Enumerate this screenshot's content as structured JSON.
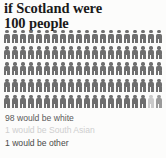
{
  "title": {
    "line1": "if Scotland were",
    "line2": "100 people"
  },
  "colors": {
    "background": "#fcfcfb",
    "title_text": "#1a1a1a",
    "white_group": "#6e6e6e",
    "south_asian_group": "#c9c9c9",
    "other_group": "#9a9a9a",
    "legend_white_text": "#5a5a5a",
    "legend_south_asian_text": "#cfcfcf",
    "legend_other_text": "#4a4a4a"
  },
  "chart_data": {
    "type": "pictogram",
    "title": "if Scotland were 100 people",
    "unit_label": "person",
    "total": 100,
    "rows": 5,
    "columns": 20,
    "icon_name": "person-icon",
    "categories": [
      "white",
      "South Asian",
      "other"
    ],
    "values": [
      98,
      1,
      1
    ],
    "series": [
      {
        "name": "white",
        "value": 98,
        "color": "#6e6e6e"
      },
      {
        "name": "South Asian",
        "value": 1,
        "color": "#c9c9c9"
      },
      {
        "name": "other",
        "value": 1,
        "color": "#9a9a9a"
      }
    ],
    "legend_position": "bottom",
    "grid": false
  },
  "legend": {
    "items": [
      {
        "label": "98 would be white",
        "count": 98,
        "group": "white",
        "swatch": "#6e6e6e",
        "text_color": "#5a5a5a"
      },
      {
        "label": "1 would be South Asian",
        "count": 1,
        "group": "South Asian",
        "swatch": "#c9c9c9",
        "text_color": "#cfcfcf"
      },
      {
        "label": "1 would be other",
        "count": 1,
        "group": "other",
        "swatch": "#9a9a9a",
        "text_color": "#4a4a4a"
      }
    ]
  }
}
